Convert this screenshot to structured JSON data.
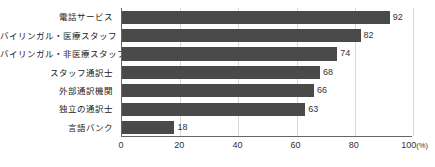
{
  "chart_data": {
    "type": "bar",
    "orientation": "horizontal",
    "title": "",
    "subtitle": "",
    "xlabel": "",
    "ylabel": "",
    "xlim": [
      0,
      100
    ],
    "xticks": [
      0,
      20,
      40,
      60,
      80,
      100
    ],
    "xtick_labels": [
      "0",
      "20",
      "40",
      "60",
      "80",
      "100"
    ],
    "x_unit_suffix": "(%)",
    "grid": true,
    "grid_axis": "x",
    "legend": null,
    "categories": [
      "電話サービス",
      "バイリンガル・医療スタッフ",
      "バイリンガル・非医療スタッフ",
      "スタッフ通訳士",
      "外部通訳機関",
      "独立の通訳士",
      "言語バンク"
    ],
    "values": [
      92,
      82,
      74,
      68,
      66,
      63,
      18
    ],
    "value_labels": [
      "92",
      "82",
      "74",
      "68",
      "66",
      "63",
      "18"
    ],
    "bar_color": "#4a4a4a",
    "axis_color": "#666666",
    "grid_color": "#d8d8d8",
    "background_color": "#ffffff"
  }
}
